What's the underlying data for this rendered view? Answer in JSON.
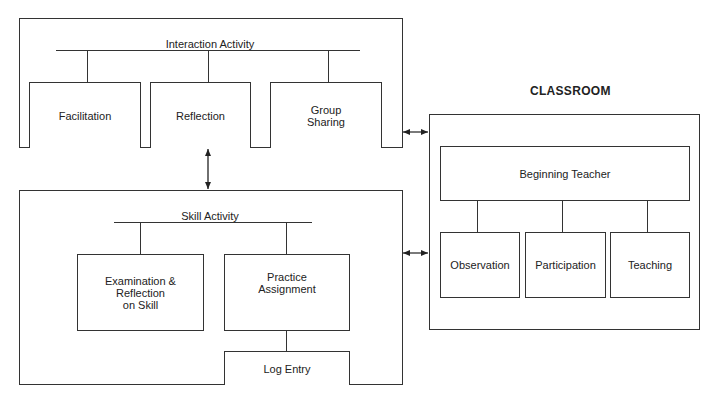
{
  "diagram": {
    "interaction_panel": {
      "heading": "Interaction Activity",
      "items": [
        {
          "label": "Facilitation"
        },
        {
          "label": "Reflection"
        },
        {
          "label": "Group\nSharing"
        }
      ]
    },
    "skill_panel": {
      "heading": "Skill Activity",
      "items": [
        {
          "label": "Examination &\nReflection\non Skill"
        },
        {
          "label": "Practice\nAssignment"
        }
      ],
      "sub_item": {
        "label": "Log Entry"
      }
    },
    "classroom_panel": {
      "title": "CLASSROOM",
      "root": {
        "label": "Beginning Teacher"
      },
      "items": [
        {
          "label": "Observation"
        },
        {
          "label": "Participation"
        },
        {
          "label": "Teaching"
        }
      ]
    },
    "connections": [
      {
        "from": "Interaction Activity",
        "to": "Skill Activity",
        "type": "bidirectional"
      },
      {
        "from": "Interaction Activity",
        "to": "CLASSROOM",
        "type": "bidirectional"
      },
      {
        "from": "Skill Activity",
        "to": "CLASSROOM",
        "type": "bidirectional"
      }
    ],
    "colors": {
      "line": "#333333",
      "background": "#ffffff"
    }
  }
}
